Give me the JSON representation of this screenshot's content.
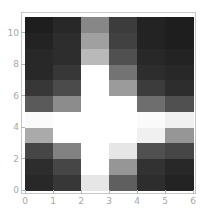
{
  "chart_data": {
    "type": "heatmap",
    "title": "",
    "xlabel": "",
    "ylabel": "",
    "xlim": [
      0,
      6
    ],
    "ylim": [
      0,
      11
    ],
    "grid": false,
    "colormap": "grayscale (dark = low, white = high)",
    "x_ticks": [
      0,
      1,
      2,
      3,
      4,
      5,
      6
    ],
    "y_ticks": [
      0,
      2,
      4,
      6,
      8,
      10
    ],
    "x_tick_labels": [
      "0",
      "1",
      "2",
      "3",
      "4",
      "5",
      "6"
    ],
    "y_tick_labels": [
      "0",
      "2",
      "4",
      "6",
      "8",
      "10"
    ],
    "columns": 6,
    "rows": 11,
    "row_order": "bottom_to_top (row 0 = y in [0,1])",
    "grey_levels_0_255": [
      [
        40,
        55,
        230,
        95,
        45,
        35
      ],
      [
        45,
        70,
        255,
        150,
        50,
        40
      ],
      [
        70,
        130,
        255,
        230,
        80,
        70
      ],
      [
        170,
        255,
        255,
        255,
        240,
        150
      ],
      [
        250,
        255,
        255,
        255,
        250,
        240
      ],
      [
        90,
        140,
        255,
        255,
        110,
        80
      ],
      [
        55,
        75,
        255,
        155,
        60,
        45
      ],
      [
        40,
        55,
        255,
        115,
        45,
        40
      ],
      [
        40,
        45,
        185,
        80,
        40,
        35
      ],
      [
        35,
        45,
        160,
        65,
        35,
        30
      ],
      [
        30,
        40,
        135,
        60,
        35,
        30
      ]
    ]
  },
  "axes": {
    "x_labels": [
      "0",
      "1",
      "2",
      "3",
      "4",
      "5",
      "6"
    ],
    "y_labels": [
      "0",
      "2",
      "4",
      "6",
      "8",
      "10"
    ]
  },
  "colors": {
    "frame": "#c8c8c8",
    "tick": "#b5b5b5",
    "tick_label": "#a8a8a8",
    "background": "#ffffff"
  }
}
